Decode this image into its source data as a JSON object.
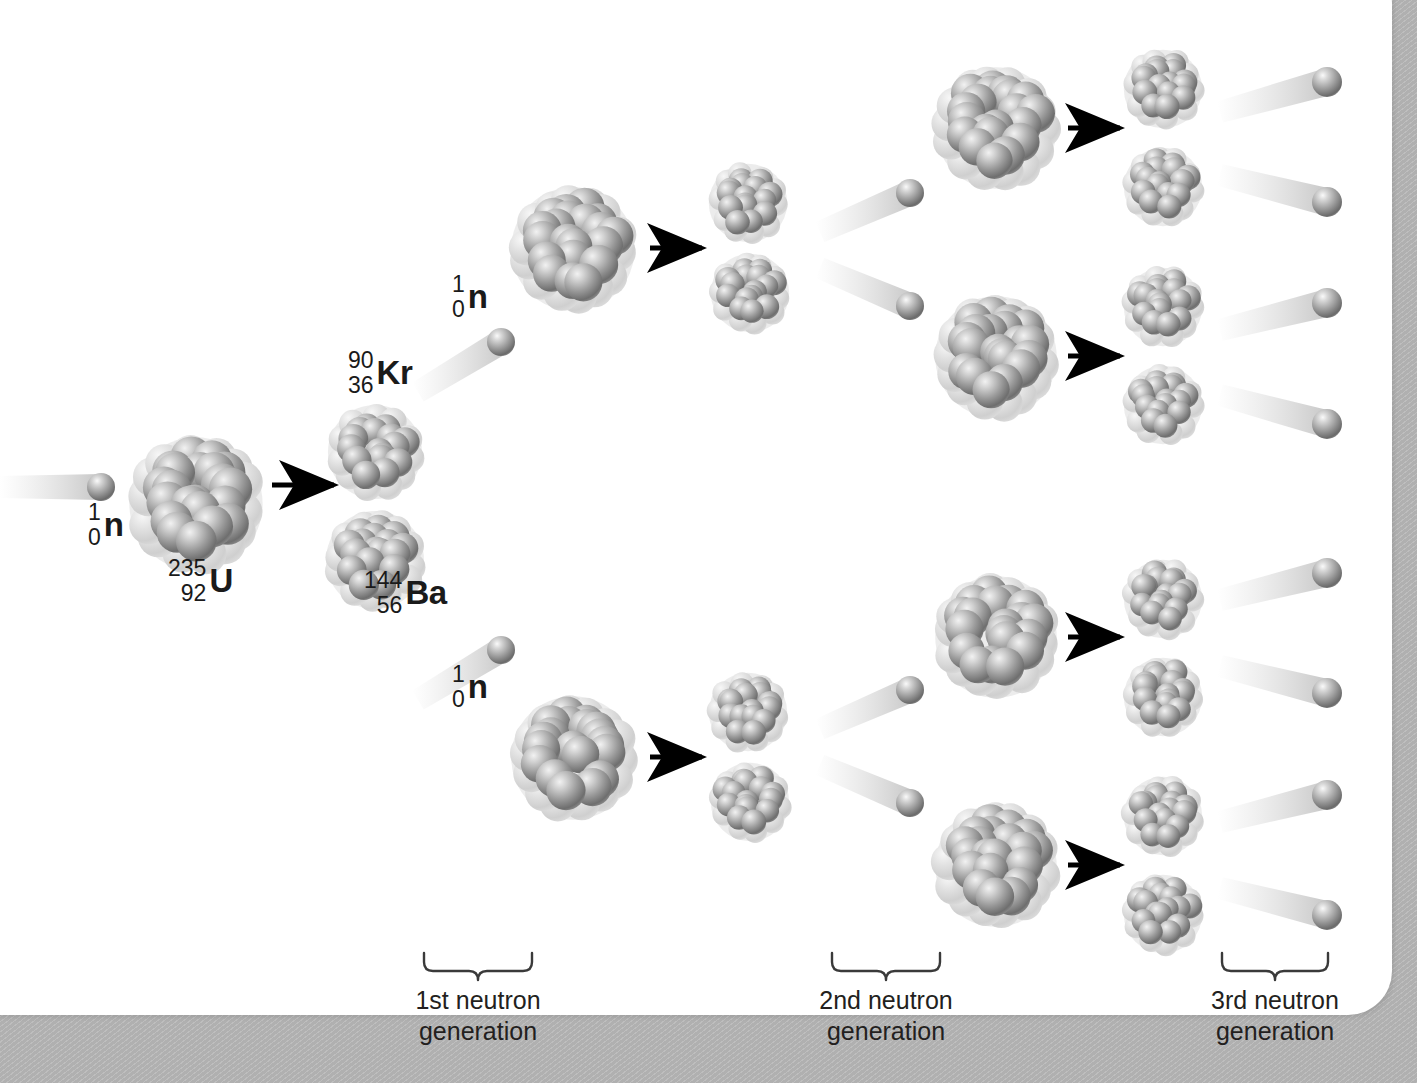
{
  "figure": {
    "background_color": "#ffffff",
    "frame_color": "#b0b0b0",
    "nucleon_color": "#8e8e8e",
    "nucleon_highlight": "#e6e6e6",
    "arrow_color": "#000000",
    "text_color": "#1a1a1a"
  },
  "labels": {
    "incoming_neutron": {
      "mass": "1",
      "atomic": "0",
      "symbol": "n"
    },
    "uranium": {
      "mass": "235",
      "atomic": "92",
      "symbol": "U"
    },
    "krypton": {
      "mass": "90",
      "atomic": "36",
      "symbol": "Kr"
    },
    "barium": {
      "mass": "144",
      "atomic": "56",
      "symbol": "Ba"
    },
    "neutron_gen1_top": {
      "mass": "1",
      "atomic": "0",
      "symbol": "n"
    },
    "neutron_gen1_bottom": {
      "mass": "1",
      "atomic": "0",
      "symbol": "n"
    }
  },
  "generations": [
    {
      "id": "gen1",
      "line1": "1st neutron",
      "line2": "generation",
      "brace_x": 424,
      "brace_y": 955,
      "brace_w": 108,
      "label_x": 363,
      "label_y": 985
    },
    {
      "id": "gen2",
      "line1": "2nd neutron",
      "line2": "generation",
      "brace_x": 832,
      "brace_y": 955,
      "brace_w": 108,
      "label_x": 771,
      "label_y": 985
    },
    {
      "id": "gen3",
      "line1": "3rd neutron",
      "line2": "generation",
      "brace_x": 1222,
      "brace_y": 955,
      "brace_w": 106,
      "label_x": 1160,
      "label_y": 985
    }
  ],
  "chart_data": {
    "type": "diagram",
    "stages": [
      {
        "generation": 0,
        "fissions": 1,
        "neutrons_released": 2
      },
      {
        "generation": 1,
        "fissions": 2,
        "neutrons_released": 4
      },
      {
        "generation": 2,
        "fissions": 4,
        "neutrons_released": 4
      },
      {
        "generation": 3,
        "fissions": 4,
        "neutrons_released": 8
      }
    ],
    "reactants": [
      "1/0 n",
      "235/92 U"
    ],
    "products": [
      "90/36 Kr",
      "144/56 Ba",
      "1/0 n"
    ]
  },
  "nuclei": [
    {
      "id": "u235-seed",
      "cx": 196,
      "cy": 504,
      "r": 68,
      "n": 26,
      "kind": "large"
    },
    {
      "id": "kr90-g1",
      "cx": 375,
      "cy": 452,
      "r": 48,
      "n": 20,
      "kind": "small"
    },
    {
      "id": "ba144-g1",
      "cx": 375,
      "cy": 560,
      "r": 50,
      "n": 21,
      "kind": "small"
    },
    {
      "id": "u235-top-g1",
      "cx": 573,
      "cy": 249,
      "r": 63,
      "n": 25,
      "kind": "large"
    },
    {
      "id": "u235-bot-g1",
      "cx": 573,
      "cy": 758,
      "r": 63,
      "n": 25,
      "kind": "large"
    },
    {
      "id": "frag-t1-g2",
      "cx": 748,
      "cy": 203,
      "r": 40,
      "n": 18,
      "kind": "small"
    },
    {
      "id": "frag-t2-g2",
      "cx": 750,
      "cy": 293,
      "r": 40,
      "n": 18,
      "kind": "small"
    },
    {
      "id": "frag-b1-g2",
      "cx": 748,
      "cy": 712,
      "r": 40,
      "n": 18,
      "kind": "small"
    },
    {
      "id": "frag-b2-g2",
      "cx": 750,
      "cy": 802,
      "r": 40,
      "n": 18,
      "kind": "small"
    },
    {
      "id": "u235-a-g2",
      "cx": 996,
      "cy": 128,
      "r": 62,
      "n": 25,
      "kind": "large"
    },
    {
      "id": "u235-b-g2",
      "cx": 996,
      "cy": 357,
      "r": 62,
      "n": 25,
      "kind": "large"
    },
    {
      "id": "u235-c-g2",
      "cx": 996,
      "cy": 637,
      "r": 62,
      "n": 25,
      "kind": "large"
    },
    {
      "id": "u235-d-g2",
      "cx": 996,
      "cy": 866,
      "r": 62,
      "n": 25,
      "kind": "large"
    },
    {
      "id": "frag-1-g3",
      "cx": 1163,
      "cy": 89,
      "r": 40,
      "n": 18,
      "kind": "small"
    },
    {
      "id": "frag-2-g3",
      "cx": 1163,
      "cy": 187,
      "r": 40,
      "n": 18,
      "kind": "small"
    },
    {
      "id": "frag-3-g3",
      "cx": 1163,
      "cy": 307,
      "r": 40,
      "n": 18,
      "kind": "small"
    },
    {
      "id": "frag-4-g3",
      "cx": 1163,
      "cy": 405,
      "r": 40,
      "n": 18,
      "kind": "small"
    },
    {
      "id": "frag-5-g3",
      "cx": 1163,
      "cy": 599,
      "r": 40,
      "n": 18,
      "kind": "small"
    },
    {
      "id": "frag-6-g3",
      "cx": 1163,
      "cy": 697,
      "r": 40,
      "n": 18,
      "kind": "small"
    },
    {
      "id": "frag-7-g3",
      "cx": 1163,
      "cy": 816,
      "r": 40,
      "n": 18,
      "kind": "small"
    },
    {
      "id": "frag-8-g3",
      "cx": 1163,
      "cy": 914,
      "r": 40,
      "n": 18,
      "kind": "small"
    }
  ],
  "neutrons": [
    {
      "id": "n-incident",
      "cx": 101,
      "cy": 487,
      "r": 14,
      "trail_x": 0,
      "trail_y": 487,
      "trail_w": 96
    },
    {
      "id": "n-g1-top",
      "cx": 501,
      "cy": 342,
      "r": 14,
      "trail_x": 418,
      "trail_y": 392,
      "trail_w": 92
    },
    {
      "id": "n-g1-bottom",
      "cx": 501,
      "cy": 650,
      "r": 14,
      "trail_x": 418,
      "trail_y": 700,
      "trail_w": 92
    },
    {
      "id": "n-g2-a",
      "cx": 910,
      "cy": 193,
      "r": 14,
      "trail_x": 820,
      "trail_y": 232,
      "trail_w": 96
    },
    {
      "id": "n-g2-b",
      "cx": 910,
      "cy": 306,
      "r": 14,
      "trail_x": 820,
      "trail_y": 268,
      "trail_w": 96
    },
    {
      "id": "n-g2-c",
      "cx": 910,
      "cy": 690,
      "r": 14,
      "trail_x": 820,
      "trail_y": 729,
      "trail_w": 96
    },
    {
      "id": "n-g2-d",
      "cx": 910,
      "cy": 803,
      "r": 14,
      "trail_x": 820,
      "trail_y": 765,
      "trail_w": 96
    },
    {
      "id": "n-g3-1",
      "cx": 1327,
      "cy": 82,
      "r": 15,
      "trail_x": 1220,
      "trail_y": 112,
      "trail_w": 112
    },
    {
      "id": "n-g3-2",
      "cx": 1327,
      "cy": 202,
      "r": 15,
      "trail_x": 1220,
      "trail_y": 175,
      "trail_w": 112
    },
    {
      "id": "n-g3-3",
      "cx": 1327,
      "cy": 303,
      "r": 15,
      "trail_x": 1220,
      "trail_y": 330,
      "trail_w": 112
    },
    {
      "id": "n-g3-4",
      "cx": 1327,
      "cy": 424,
      "r": 15,
      "trail_x": 1220,
      "trail_y": 395,
      "trail_w": 112
    },
    {
      "id": "n-g3-5",
      "cx": 1327,
      "cy": 573,
      "r": 15,
      "trail_x": 1220,
      "trail_y": 600,
      "trail_w": 112
    },
    {
      "id": "n-g3-6",
      "cx": 1327,
      "cy": 693,
      "r": 15,
      "trail_x": 1220,
      "trail_y": 666,
      "trail_w": 112
    },
    {
      "id": "n-g3-7",
      "cx": 1327,
      "cy": 795,
      "r": 15,
      "trail_x": 1220,
      "trail_y": 822,
      "trail_w": 112
    },
    {
      "id": "n-g3-8",
      "cx": 1327,
      "cy": 915,
      "r": 15,
      "trail_x": 1220,
      "trail_y": 888,
      "trail_w": 112
    }
  ],
  "arrows": [
    {
      "id": "arrow-seed",
      "x1": 272,
      "y1": 485,
      "x2": 344,
      "y2": 485
    },
    {
      "id": "arrow-g1-top",
      "x1": 650,
      "y1": 248,
      "x2": 712,
      "y2": 248
    },
    {
      "id": "arrow-g1-bot",
      "x1": 650,
      "y1": 757,
      "x2": 712,
      "y2": 757
    },
    {
      "id": "arrow-g2-a",
      "x1": 1068,
      "y1": 128,
      "x2": 1130,
      "y2": 128
    },
    {
      "id": "arrow-g2-b",
      "x1": 1068,
      "y1": 356,
      "x2": 1130,
      "y2": 356
    },
    {
      "id": "arrow-g2-c",
      "x1": 1068,
      "y1": 637,
      "x2": 1130,
      "y2": 637
    },
    {
      "id": "arrow-g2-d",
      "x1": 1068,
      "y1": 865,
      "x2": 1130,
      "y2": 865
    }
  ],
  "label_positions": {
    "incoming_neutron": {
      "x": 88,
      "y": 500
    },
    "uranium": {
      "x": 168,
      "y": 556
    },
    "krypton": {
      "x": 348,
      "y": 348
    },
    "barium": {
      "x": 364,
      "y": 568
    },
    "neutron_gen1_top": {
      "x": 452,
      "y": 272
    },
    "neutron_gen1_bottom": {
      "x": 452,
      "y": 662
    }
  }
}
